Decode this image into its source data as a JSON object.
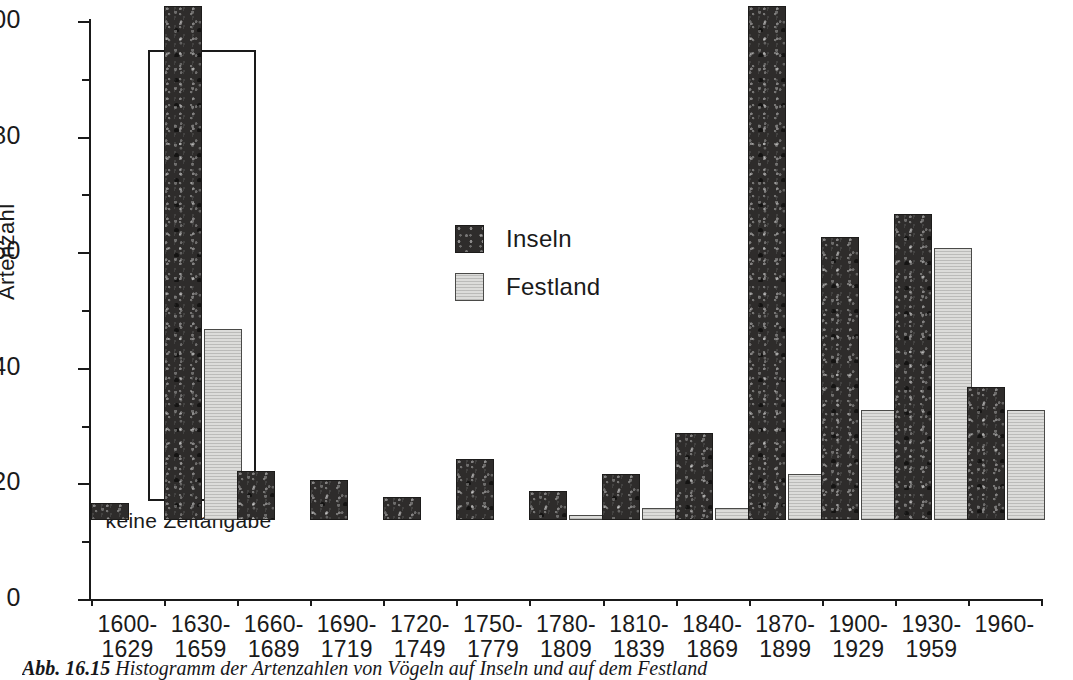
{
  "figure": {
    "caption_label": "Abb. 16.15",
    "caption_text": "Histogramm der Artenzahlen von Vögeln auf Inseln und auf dem Festland"
  },
  "axes": {
    "y_title": "Artenzahl",
    "y_ticks_major": [
      "0",
      "20",
      "40",
      "60",
      "80",
      "100"
    ],
    "y_min": 0,
    "y_max": 100
  },
  "legend": {
    "position": "upper-center-left",
    "entries": [
      {
        "label": "Inseln",
        "color": "#2e2c2b"
      },
      {
        "label": "Festland",
        "color": "#dcdcda"
      }
    ]
  },
  "annotations": {
    "inset_caption": "keine Zeitangabe"
  },
  "chart_data": {
    "type": "bar",
    "title": "Histogramm der Artenzahlen",
    "xlabel": "",
    "ylabel": "Artenzahl",
    "ylim": [
      0,
      100
    ],
    "grid": false,
    "legend_position": "upper-center-left",
    "categories": [
      "1600-\n1629",
      "1630-\n1659",
      "1660-\n1689",
      "1690-\n1719",
      "1720-\n1749",
      "1750-\n1779",
      "1780-\n1809",
      "1810-\n1839",
      "1840-\n1869",
      "1870-\n1899",
      "1900-\n1929",
      "1930-\n1959",
      "1960-"
    ],
    "category_lines": [
      [
        "1600-",
        "1629"
      ],
      [
        "1630-",
        "1659"
      ],
      [
        "1660-",
        "1689"
      ],
      [
        "1690-",
        "1719"
      ],
      [
        "1720-",
        "1749"
      ],
      [
        "1750-",
        "1779"
      ],
      [
        "1780-",
        "1809"
      ],
      [
        "1810-",
        "1839"
      ],
      [
        "1840-",
        "1869"
      ],
      [
        "1870-",
        "1899"
      ],
      [
        "1900-",
        "1929"
      ],
      [
        "1930-",
        "1959"
      ],
      [
        "1960-",
        ""
      ]
    ],
    "series": [
      {
        "name": "Inseln",
        "color": "#2e2c2b",
        "values": [
          3,
          89,
          8.5,
          7,
          4,
          10.5,
          5,
          8,
          15,
          89,
          49,
          53,
          23
        ]
      },
      {
        "name": "Festland",
        "color": "#dcdcda",
        "values": [
          0,
          33,
          0,
          0,
          0,
          0,
          0.8,
          2,
          2,
          8,
          19,
          47,
          19
        ]
      }
    ],
    "annotations": [
      {
        "text": "keine Zeitangabe",
        "applies_to_category": "1630-1659",
        "note": "boxed inset: bars for this category are enclosed in an outlined frame"
      }
    ]
  }
}
